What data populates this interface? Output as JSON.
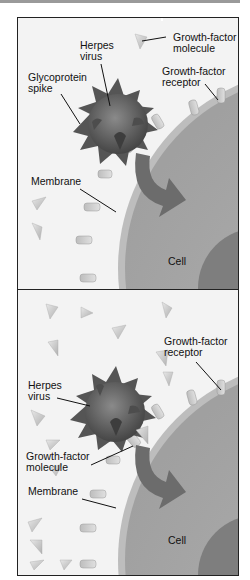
{
  "figure": {
    "colors": {
      "background": "#f2f2f2",
      "cell": "#a8a8a8",
      "membrane": "#b9b9b9",
      "nucleus": "#7c7c7c",
      "virus": "#5e5e5e",
      "arrow": "#6a6a6a",
      "border": "#222222"
    }
  },
  "panel1": {
    "labels": {
      "growth_factor_molecule_l1": "Growth-factor",
      "growth_factor_molecule_l2": "molecule",
      "herpes_virus_l1": "Herpes",
      "herpes_virus_l2": "virus",
      "growth_factor_receptor_l1": "Growth-factor",
      "growth_factor_receptor_l2": "receptor",
      "glycoprotein_spike_l1": "Glycoprotein",
      "glycoprotein_spike_l2": "spike",
      "membrane": "Membrane",
      "cell": "Cell"
    }
  },
  "panel2": {
    "labels": {
      "growth_factor_receptor_l1": "Growth-factor",
      "growth_factor_receptor_l2": "receptor",
      "herpes_virus_l1": "Herpes",
      "herpes_virus_l2": "virus",
      "growth_factor_molecule_l1": "Growth-factor",
      "growth_factor_molecule_l2": "molecule",
      "membrane": "Membrane",
      "cell": "Cell"
    }
  }
}
